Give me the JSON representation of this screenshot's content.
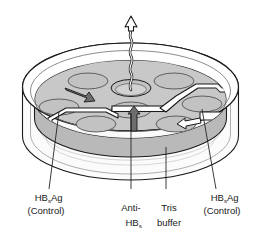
{
  "figure": {
    "colors": {
      "gel": "#c8c8c8",
      "gel_shadow": "#b4b4b4",
      "dish_wall": "#f4f4f4",
      "outline": "#1a1a1a",
      "arrow_dark": "#6e6e6e",
      "arrow_white": "#ffffff",
      "trough": "#ffffff",
      "label_text": "#1a1a1a"
    }
  },
  "labels": {
    "left": {
      "name": "hbsag-control-left",
      "line1_pre": "HB",
      "line1_sub": "s",
      "line1_post": "Ag",
      "line2": "(Control)"
    },
    "center_left": {
      "name": "anti-hbs",
      "line1": "Anti-",
      "line2_pre": "HB",
      "line2_sub": "s",
      "line2_post": ""
    },
    "center_right": {
      "name": "tris-buffer",
      "line1": "Tris",
      "line2": "buffer"
    },
    "right": {
      "name": "hbsag-control-right",
      "line1_pre": "HB",
      "line1_sub": "s",
      "line1_post": "Ag",
      "line2": "(Control)"
    }
  },
  "arrows": {
    "wavy_up": "wavy-arrow-up",
    "upper_left": "gray-arrow-right",
    "center": "gray-arrow-up",
    "right": "white-arrow-left"
  },
  "wells": {
    "center_ring": "center-ring-well",
    "count": 6
  }
}
